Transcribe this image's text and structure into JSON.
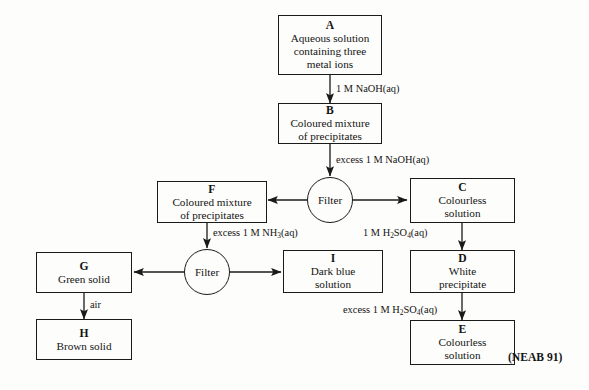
{
  "diagram": {
    "title_credit": "(NEAB 91)",
    "filter_label": "Filter",
    "nodes": [
      {
        "id": "A",
        "tag": "A",
        "body": "Aqueous solution\ncontaining three\nmetal ions"
      },
      {
        "id": "B",
        "tag": "B",
        "body": "Coloured mixture\nof precipitates"
      },
      {
        "id": "C",
        "tag": "C",
        "body": "Colourless\nsolution"
      },
      {
        "id": "D",
        "tag": "D",
        "body": "White\nprecipitate"
      },
      {
        "id": "E",
        "tag": "E",
        "body": "Colourless\nsolution"
      },
      {
        "id": "F",
        "tag": "F",
        "body": "Coloured mixture\nof precipitates"
      },
      {
        "id": "G",
        "tag": "G",
        "body": "Green solid"
      },
      {
        "id": "H",
        "tag": "H",
        "body": "Brown solid"
      },
      {
        "id": "I",
        "tag": "I",
        "body": "Dark blue\nsolution"
      }
    ],
    "edge_labels": [
      {
        "id": "a-to-b",
        "text": "1 M NaOH(aq)"
      },
      {
        "id": "b-to-filter1",
        "text": "excess 1 M NaOH(aq)"
      },
      {
        "id": "c-to-d",
        "text": "1 M H2SO4(aq)",
        "html": "1 M H<sub>2</sub>SO<sub>4</sub>(aq)"
      },
      {
        "id": "d-to-e",
        "text": "excess 1 M H2SO4(aq)",
        "html": "excess 1 M H<sub>2</sub>SO<sub>4</sub>(aq)"
      },
      {
        "id": "f-to-filter2",
        "text": "excess 1 M NH3(aq)",
        "html": "excess 1 M NH<sub>3</sub>(aq)"
      },
      {
        "id": "g-to-h",
        "text": "air"
      }
    ]
  },
  "chart_data": {
    "type": "diagram",
    "nodes": [
      {
        "id": "A",
        "label": "Aqueous solution containing three metal ions"
      },
      {
        "id": "B",
        "label": "Coloured mixture of precipitates"
      },
      {
        "id": "C",
        "label": "Colourless solution"
      },
      {
        "id": "D",
        "label": "White precipitate"
      },
      {
        "id": "E",
        "label": "Colourless solution"
      },
      {
        "id": "F",
        "label": "Coloured mixture of precipitates"
      },
      {
        "id": "G",
        "label": "Green solid"
      },
      {
        "id": "H",
        "label": "Brown solid"
      },
      {
        "id": "I",
        "label": "Dark blue solution"
      },
      {
        "id": "FILTER1",
        "label": "Filter"
      },
      {
        "id": "FILTER2",
        "label": "Filter"
      }
    ],
    "edges": [
      {
        "from": "A",
        "to": "B",
        "label": "1 M NaOH(aq)"
      },
      {
        "from": "B",
        "to": "FILTER1",
        "label": "excess 1 M NaOH(aq)"
      },
      {
        "from": "FILTER1",
        "to": "F",
        "label": ""
      },
      {
        "from": "FILTER1",
        "to": "C",
        "label": ""
      },
      {
        "from": "C",
        "to": "D",
        "label": "1 M H2SO4(aq)"
      },
      {
        "from": "D",
        "to": "E",
        "label": "excess 1 M H2SO4(aq)"
      },
      {
        "from": "F",
        "to": "FILTER2",
        "label": "excess 1 M NH3(aq)"
      },
      {
        "from": "FILTER2",
        "to": "G",
        "label": ""
      },
      {
        "from": "FILTER2",
        "to": "I",
        "label": ""
      },
      {
        "from": "G",
        "to": "H",
        "label": "air"
      }
    ]
  }
}
